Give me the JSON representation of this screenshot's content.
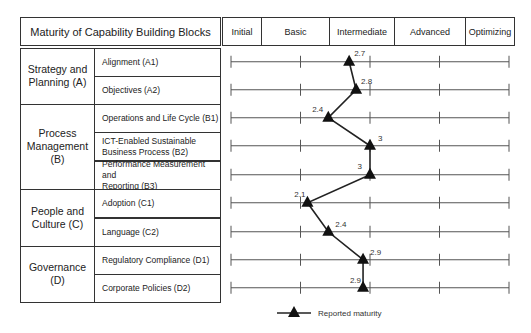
{
  "header": {
    "title": "Maturity of Capability Building Blocks",
    "levels": [
      "Initial",
      "Basic",
      "Intermediate",
      "Advanced",
      "Optimizing"
    ]
  },
  "groups": [
    {
      "label": "Strategy and Planning (A)",
      "lines": [
        "Strategy and",
        "Planning (A)"
      ]
    },
    {
      "label": "Process Management (B)",
      "lines": [
        "Process",
        "Management",
        "(B)"
      ]
    },
    {
      "label": "People and Culture (C)",
      "lines": [
        "People and",
        "Culture (C)"
      ]
    },
    {
      "label": "Governance (D)",
      "lines": [
        "Governance",
        "(D)"
      ]
    }
  ],
  "items": [
    {
      "lines": [
        "Alignment (A1)"
      ],
      "value": "2.7"
    },
    {
      "lines": [
        "Objectives (A2)"
      ],
      "value": "2.8"
    },
    {
      "lines": [
        "Operations and Life Cycle (B1)"
      ],
      "value": "2.4"
    },
    {
      "lines": [
        "ICT-Enabled Sustainable",
        "Business Process (B2)"
      ],
      "value": "3"
    },
    {
      "lines": [
        "Performance Measurement and",
        "Reporting (B3)"
      ],
      "value": "3"
    },
    {
      "lines": [
        "Adoption (C1)"
      ],
      "value": "2.1"
    },
    {
      "lines": [
        "Language (C2)"
      ],
      "value": "2.4"
    },
    {
      "lines": [
        "Regulatory Compliance (D1)"
      ],
      "value": "2.9"
    },
    {
      "lines": [
        "Corporate Policies (D2)"
      ],
      "value": "2.9"
    }
  ],
  "legend": {
    "label": "Reported maturity"
  },
  "colors": {
    "line": "#222222",
    "marker": "#111111",
    "border": "#333333",
    "scale": "#555555"
  },
  "chart_data": {
    "type": "line",
    "title": "Maturity of Capability Building Blocks",
    "orientation": "horizontal",
    "categories": [
      "Alignment (A1)",
      "Objectives (A2)",
      "Operations and Life Cycle (B1)",
      "ICT-Enabled Sustainable Business Process (B2)",
      "Performance Measurement and Reporting (B3)",
      "Adoption (C1)",
      "Language (C2)",
      "Regulatory Compliance (D1)",
      "Corporate Policies (D2)"
    ],
    "category_groups": [
      {
        "name": "Strategy and Planning (A)",
        "items": [
          "Alignment (A1)",
          "Objectives (A2)"
        ]
      },
      {
        "name": "Process Management (B)",
        "items": [
          "Operations and Life Cycle (B1)",
          "ICT-Enabled Sustainable Business Process (B2)",
          "Performance Measurement and Reporting (B3)"
        ]
      },
      {
        "name": "People and Culture (C)",
        "items": [
          "Adoption (C1)",
          "Language (C2)"
        ]
      },
      {
        "name": "Governance (D)",
        "items": [
          "Regulatory Compliance (D1)",
          "Corporate Policies (D2)"
        ]
      }
    ],
    "series": [
      {
        "name": "Reported maturity",
        "marker": "triangle",
        "values": [
          2.7,
          2.8,
          2.4,
          3.0,
          3.0,
          2.1,
          2.4,
          2.9,
          2.9
        ]
      }
    ],
    "xlabel": "Maturity level",
    "xticks": [
      1,
      2,
      3,
      4,
      5
    ],
    "xtick_labels": [
      "Initial",
      "Basic",
      "Intermediate",
      "Advanced",
      "Optimizing"
    ],
    "xlim": [
      1,
      5
    ],
    "grid": false,
    "legend_position": "bottom"
  }
}
